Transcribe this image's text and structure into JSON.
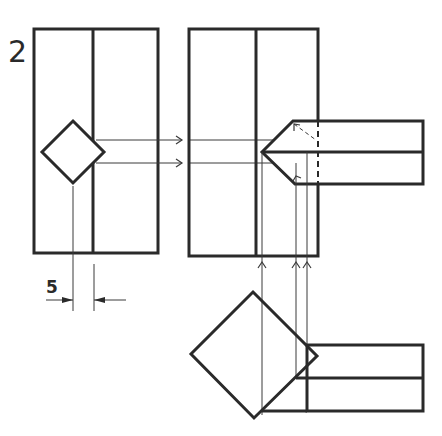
{
  "figure": {
    "number_label": "2",
    "dimension_label": "5",
    "stroke_color": "#2a2a2a",
    "background": "#ffffff"
  },
  "views": [
    {
      "name": "front-view",
      "description": "Rectangular block with vertical dividing line and square rotated 45°"
    },
    {
      "name": "side-view",
      "description": "Rectangular block with projected pointed (chamfered) bar"
    },
    {
      "name": "top-view",
      "description": "Square rotated 45° with attached bar"
    }
  ]
}
